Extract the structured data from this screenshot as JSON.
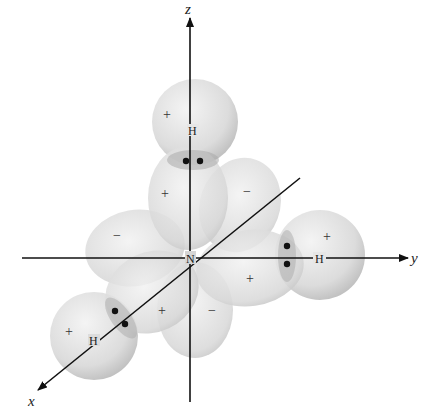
{
  "diagram": {
    "axes": [
      {
        "id": "z",
        "label": "z",
        "direction": "up"
      },
      {
        "id": "y",
        "label": "y",
        "direction": "right"
      },
      {
        "id": "x",
        "label": "x",
        "direction": "down-left"
      }
    ],
    "central_atom": {
      "label": "N"
    },
    "hydrogens": [
      {
        "id": "top",
        "label": "H",
        "sign": "+",
        "axis": "z"
      },
      {
        "id": "right",
        "label": "H",
        "sign": "+",
        "axis": "y"
      },
      {
        "id": "front",
        "label": "H",
        "sign": "+",
        "axis": "x"
      }
    ],
    "lobes": [
      {
        "id": "upper",
        "sign": "+"
      },
      {
        "id": "upper-back",
        "sign": "−"
      },
      {
        "id": "left",
        "sign": "−"
      },
      {
        "id": "right",
        "sign": "+"
      },
      {
        "id": "lower-front",
        "sign": "+"
      },
      {
        "id": "bottom",
        "sign": "−"
      }
    ],
    "electron_pairs": [
      {
        "between": "N-H top"
      },
      {
        "between": "N-H right"
      },
      {
        "between": "N-H front"
      }
    ],
    "colors": {
      "sphere_fill": "#d9d9d9",
      "sphere_edge": "#b8b8b8",
      "overlap": "#a9a9a9",
      "axis": "#111111",
      "dot": "#111111"
    }
  }
}
